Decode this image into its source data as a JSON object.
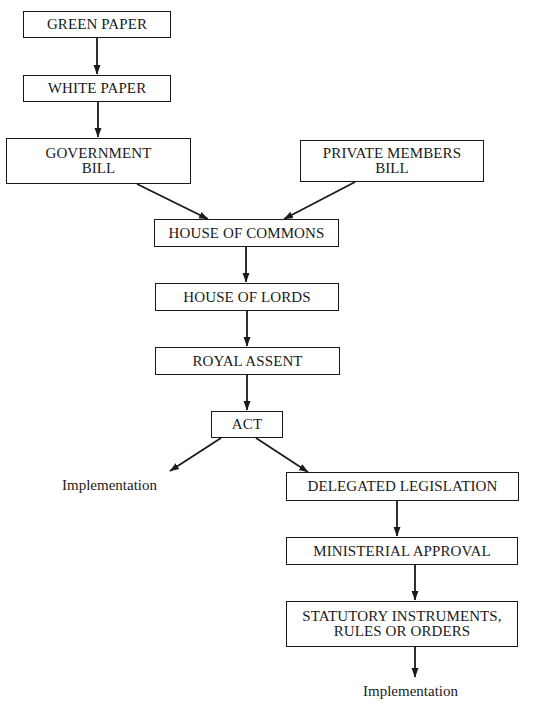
{
  "diagram": {
    "type": "flowchart",
    "title": "",
    "nodes": [
      {
        "id": "green_paper",
        "lines": [
          "GREEN PAPER"
        ]
      },
      {
        "id": "white_paper",
        "lines": [
          "WHITE PAPER"
        ]
      },
      {
        "id": "government_bill",
        "lines": [
          "GOVERNMENT",
          "BILL"
        ]
      },
      {
        "id": "private_members_bill",
        "lines": [
          "PRIVATE MEMBERS",
          "BILL"
        ]
      },
      {
        "id": "house_of_commons",
        "lines": [
          "HOUSE OF COMMONS"
        ]
      },
      {
        "id": "house_of_lords",
        "lines": [
          "HOUSE OF LORDS"
        ]
      },
      {
        "id": "royal_assent",
        "lines": [
          "ROYAL ASSENT"
        ]
      },
      {
        "id": "act",
        "lines": [
          "ACT"
        ]
      },
      {
        "id": "implementation_left",
        "lines": [
          "Implementation"
        ]
      },
      {
        "id": "delegated_legislation",
        "lines": [
          "DELEGATED LEGISLATION"
        ]
      },
      {
        "id": "ministerial_approval",
        "lines": [
          "MINISTERIAL APPROVAL"
        ]
      },
      {
        "id": "statutory_instruments",
        "lines": [
          "STATUTORY INSTRUMENTS,",
          "RULES OR ORDERS"
        ]
      },
      {
        "id": "implementation_bottom",
        "lines": [
          "Implementation"
        ]
      }
    ],
    "edges": [
      {
        "from": "green_paper",
        "to": "white_paper"
      },
      {
        "from": "white_paper",
        "to": "government_bill"
      },
      {
        "from": "government_bill",
        "to": "house_of_commons"
      },
      {
        "from": "private_members_bill",
        "to": "house_of_commons"
      },
      {
        "from": "house_of_commons",
        "to": "house_of_lords"
      },
      {
        "from": "house_of_lords",
        "to": "royal_assent"
      },
      {
        "from": "royal_assent",
        "to": "act"
      },
      {
        "from": "act",
        "to": "implementation_left"
      },
      {
        "from": "act",
        "to": "delegated_legislation"
      },
      {
        "from": "delegated_legislation",
        "to": "ministerial_approval"
      },
      {
        "from": "ministerial_approval",
        "to": "statutory_instruments"
      },
      {
        "from": "statutory_instruments",
        "to": "implementation_bottom"
      }
    ],
    "colors": {
      "stroke": "#1a1a1a",
      "background": "#ffffff"
    }
  }
}
